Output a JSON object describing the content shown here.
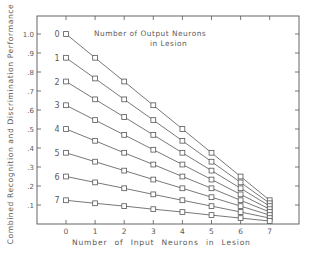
{
  "chart_data": {
    "type": "line",
    "title": "",
    "xlabel": "Number of Input Neurons in Lesion",
    "ylabel": "Combined Recognition and Discrimination Performance",
    "legend_title": [
      "Number of Output Neurons",
      "in Lesion"
    ],
    "x": [
      0,
      1,
      2,
      3,
      4,
      5,
      6,
      7
    ],
    "x_tick_labels": [
      "0",
      "1",
      "2",
      "3",
      "4",
      "5",
      "6",
      "7"
    ],
    "y_tick_labels": [
      ".1",
      ".2",
      ".3",
      ".4",
      ".5",
      ".6",
      ".7",
      ".8",
      ".9",
      "1.0"
    ],
    "ylim": [
      0,
      1.1
    ],
    "xlim": [
      -1,
      8
    ],
    "grid": false,
    "legend_position": "inline-left",
    "marker": "square",
    "series": [
      {
        "name": "0",
        "values": [
          1.0,
          0.875,
          0.75,
          0.625,
          0.5,
          0.375,
          0.25,
          0.125
        ]
      },
      {
        "name": "1",
        "values": [
          0.875,
          0.766,
          0.656,
          0.547,
          0.438,
          0.328,
          0.219,
          0.109
        ]
      },
      {
        "name": "2",
        "values": [
          0.75,
          0.656,
          0.563,
          0.469,
          0.375,
          0.281,
          0.188,
          0.094
        ]
      },
      {
        "name": "3",
        "values": [
          0.625,
          0.547,
          0.469,
          0.391,
          0.313,
          0.234,
          0.156,
          0.078
        ]
      },
      {
        "name": "4",
        "values": [
          0.5,
          0.438,
          0.375,
          0.313,
          0.25,
          0.188,
          0.125,
          0.063
        ]
      },
      {
        "name": "5",
        "values": [
          0.375,
          0.328,
          0.281,
          0.234,
          0.188,
          0.141,
          0.094,
          0.047
        ]
      },
      {
        "name": "6",
        "values": [
          0.25,
          0.219,
          0.188,
          0.156,
          0.125,
          0.094,
          0.063,
          0.031
        ]
      },
      {
        "name": "7",
        "values": [
          0.125,
          0.109,
          0.094,
          0.078,
          0.063,
          0.047,
          0.031,
          0.016
        ]
      }
    ],
    "colors": {
      "line": "#555555",
      "text": "#5a5a5a",
      "background": "#ffffff"
    }
  }
}
